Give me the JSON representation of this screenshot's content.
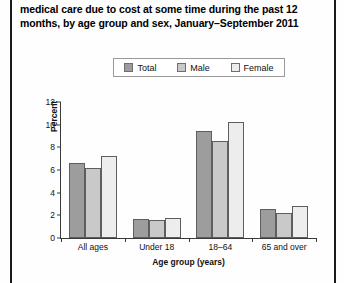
{
  "caption": {
    "line1": "medical care due to cost at some time during the past 12",
    "line2": "months, by age group and sex, January–September 2011"
  },
  "legend": {
    "position": "top-center",
    "entries": [
      {
        "label": "Total",
        "color": "#9d9d9d"
      },
      {
        "label": "Male",
        "color": "#c9c9c9"
      },
      {
        "label": "Female",
        "color": "#ededed"
      }
    ]
  },
  "chart_data": {
    "type": "bar",
    "title": "",
    "categories": [
      "All ages",
      "Under 18",
      "18–64",
      "65 and over"
    ],
    "series": [
      {
        "name": "Total",
        "values": [
          6.6,
          1.7,
          9.4,
          2.6
        ],
        "color": "#9d9d9d"
      },
      {
        "name": "Male",
        "values": [
          6.2,
          1.6,
          8.6,
          2.2
        ],
        "color": "#c9c9c9"
      },
      {
        "name": "Female",
        "values": [
          7.2,
          1.8,
          10.2,
          2.8
        ],
        "color": "#ededed"
      }
    ],
    "xlabel": "Age group (years)",
    "ylabel": "Percent",
    "ylim": [
      0,
      12
    ],
    "yticks": [
      0,
      2,
      4,
      6,
      8,
      10,
      12
    ],
    "ytick_labels": [
      "0",
      "2",
      "4",
      "6",
      "8",
      "10",
      "12"
    ],
    "grid": false,
    "legend_position": "top-center"
  }
}
